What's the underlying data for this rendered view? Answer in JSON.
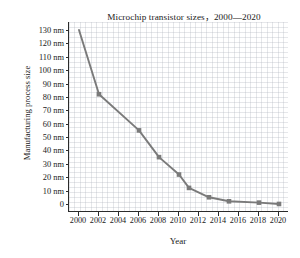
{
  "chart_data": {
    "type": "line",
    "title": "Microchip transistor sizes，2000—2020",
    "xlabel": "Year",
    "ylabel": "Manufacturing process size",
    "xlim": [
      1999,
      2021
    ],
    "ylim": [
      -6,
      136
    ],
    "grid": "minor gridlines only, very light gray",
    "legend": "none",
    "series_color": "#7a7a7a",
    "marker": "square",
    "x": [
      2000,
      2002,
      2006,
      2008,
      2010,
      2011,
      2013,
      2015,
      2018,
      2020
    ],
    "values": [
      130,
      82,
      55,
      35,
      22,
      12,
      5,
      2,
      1,
      0
    ],
    "points": [
      {
        "year": 2000,
        "size": 130
      },
      {
        "year": 2002,
        "size": 82
      },
      {
        "year": 2006,
        "size": 55
      },
      {
        "year": 2008,
        "size": 35
      },
      {
        "year": 2010,
        "size": 22
      },
      {
        "year": 2011,
        "size": 12
      },
      {
        "year": 2013,
        "size": 5
      },
      {
        "year": 2015,
        "size": 2
      },
      {
        "year": 2018,
        "size": 1
      },
      {
        "year": 2020,
        "size": 0
      }
    ],
    "yticks": [
      {
        "value": 0,
        "label": "0"
      },
      {
        "value": 10,
        "label": "10 nm"
      },
      {
        "value": 20,
        "label": "20 nm"
      },
      {
        "value": 30,
        "label": "30 nm"
      },
      {
        "value": 40,
        "label": "40 nm"
      },
      {
        "value": 50,
        "label": "50 nm"
      },
      {
        "value": 60,
        "label": "60 nm"
      },
      {
        "value": 70,
        "label": "70 nm"
      },
      {
        "value": 80,
        "label": "80 nm"
      },
      {
        "value": 90,
        "label": "90 nm"
      },
      {
        "value": 100,
        "label": "100 nm"
      },
      {
        "value": 110,
        "label": "110 nm"
      },
      {
        "value": 120,
        "label": "120 nm"
      },
      {
        "value": 130,
        "label": "130 nm"
      }
    ],
    "xticks": [
      {
        "value": 2000,
        "label": "2000"
      },
      {
        "value": 2002,
        "label": "2002"
      },
      {
        "value": 2004,
        "label": "2004"
      },
      {
        "value": 2006,
        "label": "2006"
      },
      {
        "value": 2008,
        "label": "2008"
      },
      {
        "value": 2010,
        "label": "2010"
      },
      {
        "value": 2012,
        "label": "2012"
      },
      {
        "value": 2014,
        "label": "2014"
      },
      {
        "value": 2016,
        "label": "2016"
      },
      {
        "value": 2018,
        "label": "2018"
      },
      {
        "value": 2020,
        "label": "2020"
      }
    ]
  }
}
